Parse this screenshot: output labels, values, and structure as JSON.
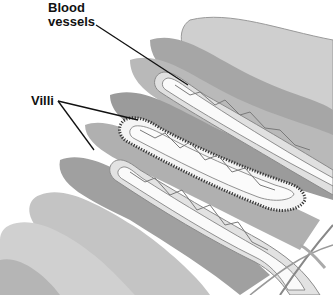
{
  "diagram": {
    "labels": [
      {
        "id": "blood-vessels",
        "lines": [
          "Blood",
          "vessels"
        ]
      },
      {
        "id": "villi",
        "lines": [
          "Villi"
        ]
      }
    ],
    "colors": {
      "background": "#ffffff",
      "light_fold": "#c9c9c9",
      "mid_fold": "#a9a9a9",
      "dark_fold": "#8e8e8e",
      "villus_wall": "#d8d8d8",
      "vessel": "#7a7a7a",
      "leader_line": "#111111"
    }
  }
}
